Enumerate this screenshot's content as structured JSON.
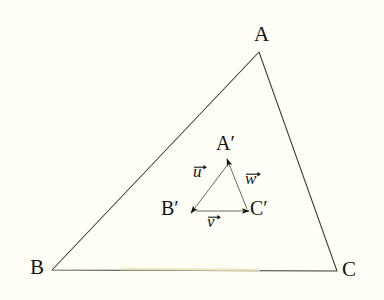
{
  "figure": {
    "background_color": "#fffef7",
    "stroke_color": "#3a3a32",
    "text_color": "#15150f",
    "outer_triangle": {
      "name": "triangle-abc",
      "vertices": [
        {
          "id": "A",
          "label": "A",
          "x": 259,
          "y": 52,
          "label_x": 254,
          "label_y": 24
        },
        {
          "id": "B",
          "label": "B",
          "x": 52,
          "y": 270,
          "label_x": 30,
          "label_y": 257
        },
        {
          "id": "C",
          "label": "C",
          "x": 337,
          "y": 271,
          "label_x": 342,
          "label_y": 259
        }
      ]
    },
    "inner_triangle": {
      "name": "triangle-a-prime-b-prime-c-prime",
      "vertices": [
        {
          "id": "A'",
          "label": "A′",
          "x": 229,
          "y": 161,
          "label_x": 216,
          "label_y": 133
        },
        {
          "id": "B'",
          "label": "B′",
          "x": 195,
          "y": 211,
          "label_x": 161,
          "label_y": 198
        },
        {
          "id": "C'",
          "label": "C′",
          "x": 247,
          "y": 211,
          "label_x": 250,
          "label_y": 198
        }
      ]
    },
    "vectors": [
      {
        "id": "u",
        "label": "u",
        "from": "A'",
        "to": "B'",
        "x1": 229,
        "y1": 163,
        "x2": 191,
        "y2": 213,
        "label_x": 193,
        "label_y": 163
      },
      {
        "id": "v",
        "label": "v",
        "from": "B'",
        "to": "C'",
        "x1": 196,
        "y1": 211,
        "x2": 249,
        "y2": 211,
        "label_x": 207,
        "label_y": 213
      },
      {
        "id": "w",
        "label": "w",
        "from": "C'",
        "to": "A'",
        "x1": 247,
        "y1": 209,
        "x2": 227,
        "y2": 159,
        "label_x": 245,
        "label_y": 170
      }
    ]
  }
}
